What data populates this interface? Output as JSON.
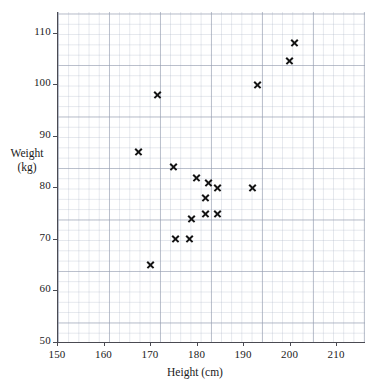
{
  "chart_data": {
    "type": "scatter",
    "title": "",
    "xlabel": "Height (cm)",
    "ylabel_line1": "Weight",
    "ylabel_line2": "(kg)",
    "ylabel": "Weight (kg)",
    "xlim": [
      150,
      216
    ],
    "ylim": [
      50,
      114
    ],
    "x_ticks": [
      150,
      160,
      170,
      180,
      190,
      200,
      210
    ],
    "y_ticks": [
      50,
      60,
      70,
      80,
      90,
      100,
      110
    ],
    "x_tick_labels": [
      "150",
      "160",
      "170",
      "180",
      "190",
      "200",
      "210"
    ],
    "y_tick_labels": [
      "50",
      "60",
      "70",
      "80",
      "90",
      "100",
      "110"
    ],
    "grid": true,
    "grid_major_step_x": 10,
    "grid_major_step_y": 10,
    "grid_minor_step_x": 2,
    "grid_minor_step_y": 2,
    "legend": null,
    "marker": "x",
    "marker_color": "#141414",
    "grid_color": "#b2baca",
    "axis_color": "#4a4a52",
    "background_color": "#ffffff",
    "point_count": 17,
    "points": [
      {
        "x": 167.5,
        "y": 87
      },
      {
        "x": 170.0,
        "y": 65
      },
      {
        "x": 171.5,
        "y": 98
      },
      {
        "x": 175.5,
        "y": 70
      },
      {
        "x": 175.0,
        "y": 84
      },
      {
        "x": 178.5,
        "y": 70
      },
      {
        "x": 179.0,
        "y": 74
      },
      {
        "x": 180.0,
        "y": 82
      },
      {
        "x": 182.0,
        "y": 75
      },
      {
        "x": 182.0,
        "y": 78
      },
      {
        "x": 182.5,
        "y": 81
      },
      {
        "x": 184.5,
        "y": 75
      },
      {
        "x": 184.5,
        "y": 80
      },
      {
        "x": 192.0,
        "y": 80
      },
      {
        "x": 193.0,
        "y": 100
      },
      {
        "x": 200.0,
        "y": 104.5
      },
      {
        "x": 201.0,
        "y": 108
      }
    ]
  }
}
